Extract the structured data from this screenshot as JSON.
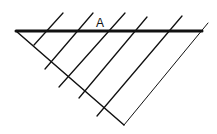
{
  "diagram": {
    "type": "geometric-construction",
    "stroke_color": "#111111",
    "background": "#ffffff",
    "label": {
      "text": "A",
      "x": 96,
      "y": 27
    },
    "top_line": {
      "x1": 16,
      "y1": 31,
      "x2": 202,
      "y2": 31,
      "width": 3
    },
    "diagonal_line": {
      "x1": 16,
      "y1": 31,
      "x2": 124,
      "y2": 125,
      "width": 1.5
    },
    "parallels": [
      {
        "x1": 34,
        "y1": 45,
        "x2": 63,
        "y2": 13
      },
      {
        "x1": 45,
        "y1": 69,
        "x2": 93,
        "y2": 13
      },
      {
        "x1": 59,
        "y1": 87,
        "x2": 125,
        "y2": 13
      },
      {
        "x1": 79,
        "y1": 98,
        "x2": 147,
        "y2": 17
      },
      {
        "x1": 97,
        "y1": 116,
        "x2": 182,
        "y2": 16
      },
      {
        "x1": 124,
        "y1": 125,
        "x2": 208,
        "y2": 23
      }
    ]
  }
}
